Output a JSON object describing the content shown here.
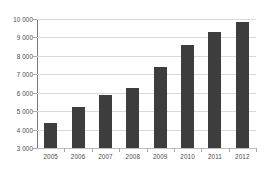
{
  "chart_data": {
    "type": "bar",
    "title": "",
    "subtitle": "",
    "xlabel": "",
    "ylabel": "",
    "categories": [
      "2005",
      "2006",
      "2007",
      "2008",
      "2009",
      "2010",
      "2011",
      "2012"
    ],
    "values": [
      4350,
      5200,
      5850,
      6250,
      7400,
      8600,
      9300,
      9850
    ],
    "series": [
      {
        "name": "",
        "values": [
          4350,
          5200,
          5850,
          6250,
          7400,
          8600,
          9300,
          9850
        ]
      }
    ],
    "ylim": [
      3000,
      10000
    ],
    "ytick_step": 1000,
    "ytick_values": [
      3000,
      4000,
      5000,
      6000,
      7000,
      8000,
      9000,
      10000
    ],
    "ytick_labels": [
      "3 000",
      "4 000",
      "5 000",
      "6 000",
      "7 000",
      "8 000",
      "9 000",
      "10 000"
    ],
    "grid": true,
    "grid_axis": "y",
    "legend": false,
    "legend_position": "none",
    "annotations": [],
    "colors": {
      "bar_fill": "#3d3d3d",
      "gridline": "#d9d9d9",
      "axis_line": "#7b7b7b",
      "tick_mark": "#a8a8a8",
      "baseline": "#bdbdbd",
      "tick_label": "#4a4a4a",
      "background": "#ffffff"
    }
  }
}
